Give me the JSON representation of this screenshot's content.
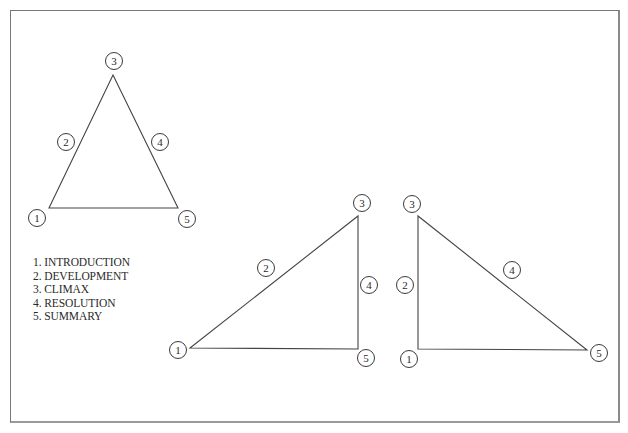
{
  "legend": {
    "items": [
      {
        "number": "1.",
        "label": "INTRODUCTION"
      },
      {
        "number": "2.",
        "label": "DEVELOPMENT"
      },
      {
        "number": "3.",
        "label": "CLIMAX"
      },
      {
        "number": "4.",
        "label": "RESOLUTION"
      },
      {
        "number": "5.",
        "label": "SUMMARY"
      }
    ],
    "lines": [
      "1. INTRODUCTION",
      "2. DEVELOPMENT",
      "3. CLIMAX",
      "4. RESOLUTION",
      "5. SUMMARY"
    ]
  },
  "diagrams": [
    {
      "name": "symmetric-triangle",
      "vertices": {
        "start": [
          49,
          208
        ],
        "peak": [
          113,
          75
        ],
        "end": [
          178,
          208
        ]
      },
      "nodes": [
        {
          "label": "1",
          "cx": 37,
          "cy": 218
        },
        {
          "label": "2",
          "cx": 66,
          "cy": 142
        },
        {
          "label": "3",
          "cx": 114,
          "cy": 61
        },
        {
          "label": "4",
          "cx": 160,
          "cy": 142
        },
        {
          "label": "5",
          "cx": 187,
          "cy": 219
        }
      ]
    },
    {
      "name": "late-climax-triangle",
      "vertices": {
        "start": [
          190,
          348
        ],
        "peak": [
          358,
          216
        ],
        "end": [
          358,
          349
        ]
      },
      "nodes": [
        {
          "label": "1",
          "cx": 178,
          "cy": 350
        },
        {
          "label": "2",
          "cx": 266,
          "cy": 268
        },
        {
          "label": "3",
          "cx": 362,
          "cy": 203
        },
        {
          "label": "4",
          "cx": 369,
          "cy": 285
        },
        {
          "label": "5",
          "cx": 366,
          "cy": 358
        }
      ]
    },
    {
      "name": "early-climax-triangle",
      "vertices": {
        "start": [
          418,
          349
        ],
        "peak": [
          418,
          216
        ],
        "end": [
          587,
          350
        ]
      },
      "nodes": [
        {
          "label": "1",
          "cx": 409,
          "cy": 359
        },
        {
          "label": "2",
          "cx": 405,
          "cy": 285
        },
        {
          "label": "3",
          "cx": 412,
          "cy": 204
        },
        {
          "label": "4",
          "cx": 512,
          "cy": 270
        },
        {
          "label": "5",
          "cx": 599,
          "cy": 353
        }
      ]
    }
  ],
  "colors": {
    "line": "#444444",
    "text": "#2a2a2a",
    "frame": "#777777",
    "background": "#ffffff"
  }
}
